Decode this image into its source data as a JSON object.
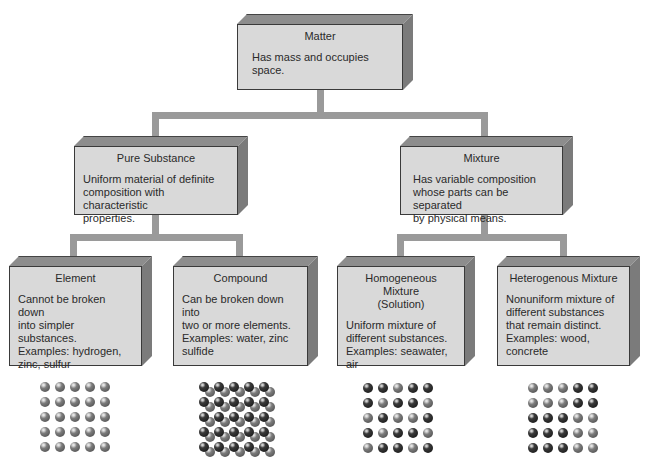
{
  "diagram": {
    "nodes": {
      "matter": {
        "title": "Matter",
        "description": "Has mass and occupies\nspace."
      },
      "pure_substance": {
        "title": "Pure Substance",
        "description": "Uniform material of definite\ncomposition with characteristic\nproperties."
      },
      "mixture": {
        "title": "Mixture",
        "description": "Has variable composition\nwhose parts can be separated\nby physical means."
      },
      "element": {
        "title": "Element",
        "description": "Cannot be broken down\ninto simpler substances.\nExamples: hydrogen,\nzinc, sulfur"
      },
      "compound": {
        "title": "Compound",
        "description": "Can be broken down into\ntwo or more elements.\nExamples: water, zinc\nsulfide"
      },
      "homogeneous": {
        "title": "Homogeneous Mixture\n(Solution)",
        "description": "Uniform mixture of\ndifferent substances.\nExamples: seawater, air"
      },
      "heterogeneous": {
        "title": "Heterogenous Mixture",
        "description": "Nonuniform mixture of\ndifferent substances\nthat remain distinct.\nExamples: wood,\nconcrete"
      }
    },
    "edges": [
      [
        "matter",
        "pure_substance"
      ],
      [
        "matter",
        "mixture"
      ],
      [
        "pure_substance",
        "element"
      ],
      [
        "pure_substance",
        "compound"
      ],
      [
        "mixture",
        "homogeneous"
      ],
      [
        "mixture",
        "heterogeneous"
      ]
    ],
    "particle_models": {
      "element": {
        "rows": 5,
        "cols": 5,
        "pattern": [
          "mmmmm",
          "mmmmm",
          "mmmmm",
          "mmmmm",
          "mmmmm"
        ],
        "paired": false
      },
      "compound": {
        "rows": 5,
        "cols": 5,
        "pattern": [
          "ddddd",
          "ddddd",
          "ddddd",
          "ddddd",
          "ddddd"
        ],
        "paired": true
      },
      "homogeneous": {
        "rows": 5,
        "cols": 5,
        "pattern": [
          "ddmdd",
          "dmddm",
          "mdmmd",
          "dmddm",
          "mddmd"
        ],
        "paired": false
      },
      "heterogeneous": {
        "rows": 5,
        "cols": 5,
        "pattern": [
          "mmmdd",
          "mmmdd",
          "dddmm",
          "dddmm",
          "dddmm"
        ],
        "paired": false
      }
    },
    "colors": {
      "box_face": "#d9d9d9",
      "box_top": "#8d8d8d",
      "box_side": "#7b7b7b",
      "connector": "#9a9a9a",
      "atom_dark": "#1a1a1a",
      "atom_mid": "#6e6e6e"
    }
  }
}
